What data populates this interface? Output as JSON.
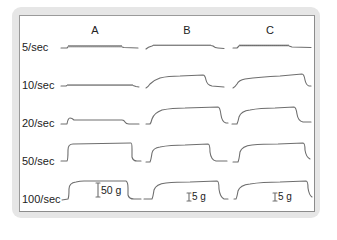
{
  "figure": {
    "columns": [
      {
        "id": "A",
        "label": "A"
      },
      {
        "id": "B",
        "label": "B"
      },
      {
        "id": "C",
        "label": "C"
      }
    ],
    "rows": [
      {
        "label": "5/sec"
      },
      {
        "label": "10/sec"
      },
      {
        "label": "20/sec"
      },
      {
        "label": "50/sec"
      },
      {
        "label": "100/sec"
      }
    ],
    "scale_bars": [
      {
        "column": "A",
        "label": "50 g"
      },
      {
        "column": "B",
        "label": "5 g"
      },
      {
        "column": "C",
        "label": "5 g"
      }
    ],
    "colors": {
      "trace": "#6e6e6e",
      "frame": "#e6e6e6",
      "panel_border": "#8c8c8c",
      "text": "#222222"
    }
  }
}
